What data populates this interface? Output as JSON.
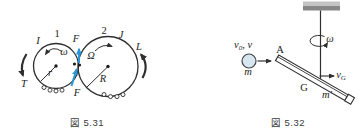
{
  "colors": {
    "line": "#2f2f2f",
    "force_blue": "#2a96d8",
    "ball_fill": "#d6e7f1",
    "ceiling_top": "#c4c4c4",
    "ceiling_bottom": "#878787"
  },
  "fig531": {
    "caption": "図 5.31",
    "gear1": {
      "number": "1",
      "inertia": "I",
      "angular_velocity": "ω",
      "radius": "r",
      "drive_torque": "T"
    },
    "gear2": {
      "number": "2",
      "inertia": "J",
      "angular_velocity": "Ω",
      "radius": "R",
      "load_torque": "L"
    },
    "contact_force_top": "F",
    "contact_force_bottom": "F"
  },
  "fig532": {
    "caption": "図 5.32",
    "ball": {
      "velocity_base": "v",
      "velocity_sub": "0",
      "velocity_rest": ", v",
      "mass": "m"
    },
    "rod": {
      "point_a": "A",
      "center_g": "G",
      "mass_base": "m",
      "mass_prime": "′",
      "axis_angular_velocity": "ω",
      "vg_base": "v",
      "vg_sub": "G"
    }
  }
}
